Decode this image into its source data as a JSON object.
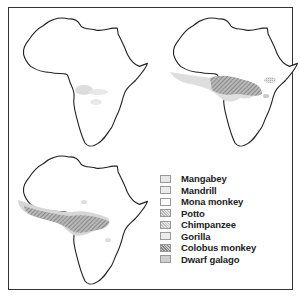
{
  "figure": {
    "maps": [
      {
        "id": "map-1",
        "label": "Mangabey, Mandrill, Mona monkey range map"
      },
      {
        "id": "map-2",
        "label": "Potto, Chimpanzee, Gorilla range map"
      },
      {
        "id": "map-3",
        "label": "Colobus monkey, Dwarf galago range map"
      }
    ],
    "legend": {
      "items": [
        {
          "label": "Mangabey",
          "fill": "#e8e8e8"
        },
        {
          "label": "Mandrill",
          "fill": "#ebebeb"
        },
        {
          "label": "Mona monkey",
          "fill": "#ffffff"
        },
        {
          "label": "Potto",
          "fill": "#c8c8c8"
        },
        {
          "label": "Chimpanzee",
          "fill": "#d4d4d4"
        },
        {
          "label": "Gorilla",
          "fill": "#ececec"
        },
        {
          "label": "Colobus monkey",
          "fill": "#aaaaaa"
        },
        {
          "label": "Dwarf galago",
          "fill": "#cfcfcf"
        }
      ]
    }
  }
}
